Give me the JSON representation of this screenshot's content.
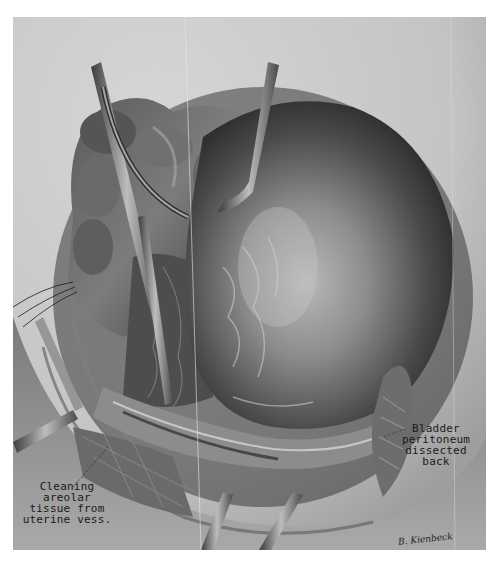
{
  "illustration": {
    "subject": "surgical-anatomical-plate",
    "tone": "grayscale",
    "colors": {
      "page_background": "#ffffff",
      "plate_background": "#c9c9c9",
      "dark_tissue": "#2b2b2b",
      "mid_tissue": "#6d6d6d",
      "highlight": "#d8d8d8",
      "instrument": "#9a9a9a",
      "text": "#1a1a1a"
    }
  },
  "annotations": {
    "bladder": {
      "lines": "Bladder\nperitoneum\ndissected\nback"
    },
    "cleaning": {
      "lines": "Cleaning\nareolar\ntissue from\nuterine vess."
    }
  },
  "signature": {
    "text": "B. Kienbeck"
  }
}
